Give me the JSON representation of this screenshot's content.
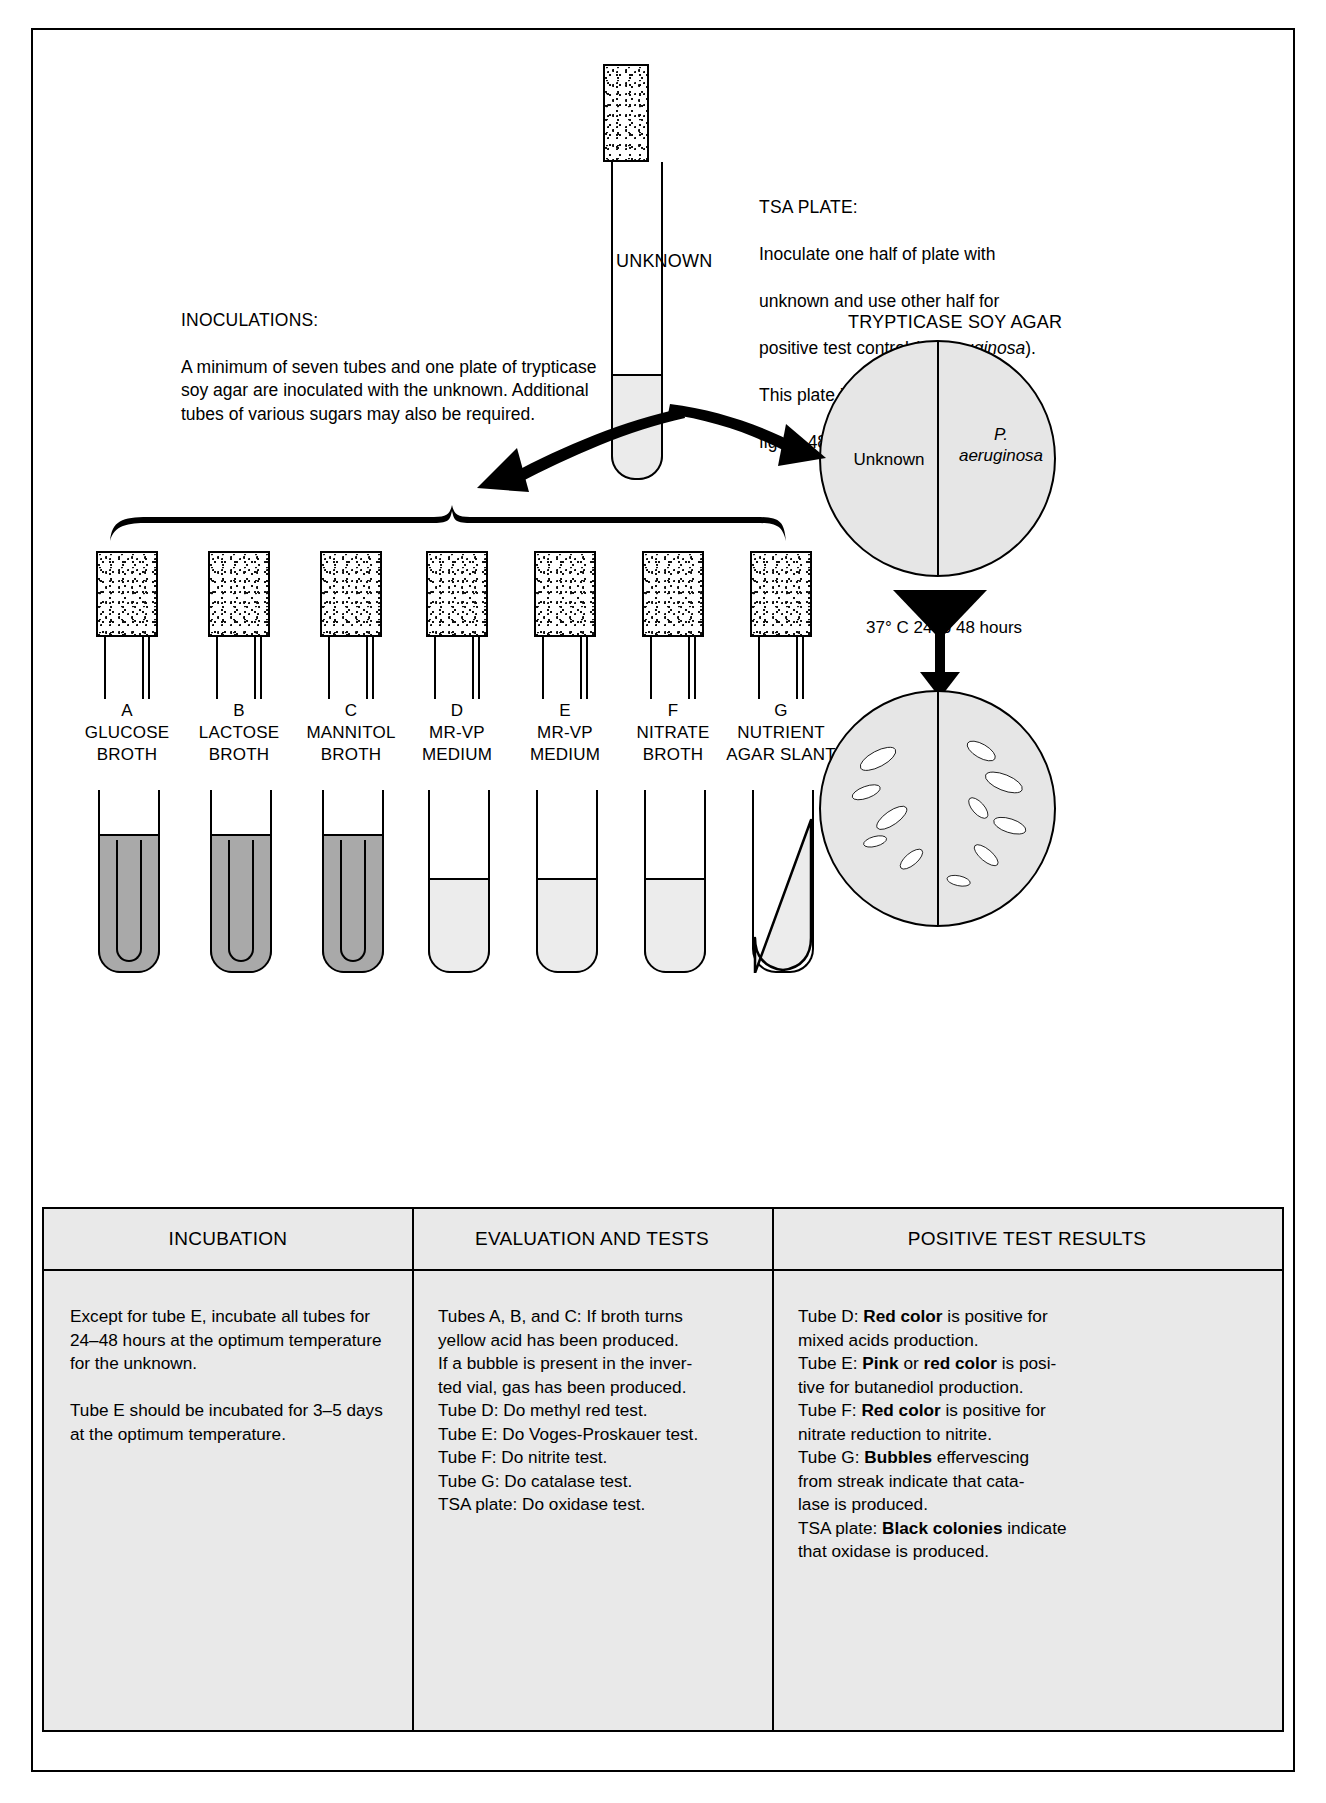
{
  "annotations": {
    "unknown_tube_label": "UNKNOWN",
    "inoculations": {
      "heading": "INOCULATIONS:",
      "body": "A minimum of seven tubes and one plate of trypticase soy agar are inoculated with the unknown. Additional tubes of various sugars may also be required."
    },
    "tsa_plate": {
      "heading": "TSA PLATE:",
      "line1": "Inoculate one half of plate with",
      "line2": "unknown and use other half for",
      "line3_pre": "positive test control (",
      "line3_italic": "P. aeruginosa",
      "line3_post": ").",
      "line4": "This plate is the same one used in",
      "line5": "figure 48.3."
    },
    "agar_title": "TRYPTICASE SOY AGAR",
    "plate_half_unknown": "Unknown",
    "plate_half_control_line1": "P.",
    "plate_half_control_line2": "aeruginosa",
    "incubation_arrow": "37° C 24 to 48 hours"
  },
  "tubes": [
    {
      "letter": "A",
      "name_line1": "GLUCOSE",
      "name_line2": "BROTH",
      "fill": "grey",
      "durham": true
    },
    {
      "letter": "B",
      "name_line1": "LACTOSE",
      "name_line2": "BROTH",
      "fill": "grey",
      "durham": true
    },
    {
      "letter": "C",
      "name_line1": "MANNITOL",
      "name_line2": "BROTH",
      "fill": "grey",
      "durham": true
    },
    {
      "letter": "D",
      "name_line1": "MR-VP",
      "name_line2": "MEDIUM",
      "fill": "pale",
      "durham": false
    },
    {
      "letter": "E",
      "name_line1": "MR-VP",
      "name_line2": "MEDIUM",
      "fill": "pale",
      "durham": false
    },
    {
      "letter": "F",
      "name_line1": "NITRATE",
      "name_line2": "BROTH",
      "fill": "pale",
      "durham": false
    },
    {
      "letter": "G",
      "name_line1": "NUTRIENT",
      "name_line2": "AGAR SLANT",
      "fill": "pale",
      "durham": false
    }
  ],
  "table": {
    "headers": [
      "INCUBATION",
      "EVALUATION AND TESTS",
      "POSITIVE TEST RESULTS"
    ],
    "incubation": {
      "para1": "Except for tube E, incubate all tubes for 24–48 hours at the optimum temperature for the unknown.",
      "para2": "Tube E should be incubated for 3–5 days at the optimum temperature."
    },
    "evaluation": {
      "line1": "Tubes A, B, and C: If broth turns",
      "line2": "yellow acid has been produced.",
      "line3": "If a bubble is present in the inver-",
      "line4": "ted vial, gas has been produced.",
      "line5": "Tube D: Do methyl red test.",
      "line6": "Tube E: Do Voges-Proskauer test.",
      "line7": "Tube F: Do nitrite test.",
      "line8": "Tube G: Do catalase test.",
      "line9": "TSA plate: Do oxidase test."
    },
    "positive": {
      "d_pre": "Tube D: ",
      "d_bold": "Red color",
      "d_post": " is positive for",
      "d_line2": "mixed acids production.",
      "e_pre": "Tube E: ",
      "e_bold1": "Pink",
      "e_mid": " or ",
      "e_bold2": "red color",
      "e_post": " is posi-",
      "e_line2": "tive for butanediol production.",
      "f_pre": "Tube F: ",
      "f_bold": "Red color",
      "f_post": " is positive for",
      "f_line2": "nitrate reduction to nitrite.",
      "g_pre": "Tube G: ",
      "g_bold": "Bubbles",
      "g_post": " effervescing",
      "g_line2": "from streak indicate that cata-",
      "g_line3": "lase is produced.",
      "t_pre": "TSA plate: ",
      "t_bold": "Black colonies",
      "t_post": " indicate",
      "t_line2": "that oxidase is produced."
    }
  },
  "colors": {
    "ink": "#000000",
    "table_fill": "#e9e9e9",
    "plate_fill": "#e6e6e6",
    "broth_dark": "#a9a9a9",
    "broth_pale": "#ececec"
  }
}
